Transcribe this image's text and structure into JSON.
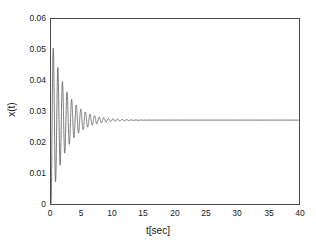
{
  "chart_data": {
    "type": "line",
    "title": "",
    "subtitle": "",
    "xlabel": "t[sec]",
    "ylabel": "x(t)",
    "xlim": [
      0,
      40
    ],
    "ylim": [
      0,
      0.06
    ],
    "grid": false,
    "legend": [],
    "legend_position": "none",
    "xticks": [
      0,
      5,
      10,
      15,
      20,
      25,
      30,
      35,
      40
    ],
    "xtick_labels": [
      "0",
      "5",
      "10",
      "15",
      "20",
      "25",
      "30",
      "35",
      "40"
    ],
    "yticks": [
      0,
      0.01,
      0.02,
      0.03,
      0.04,
      0.05,
      0.06
    ],
    "ytick_labels": [
      "0",
      "0.01",
      "0.02",
      "0.03",
      "0.04",
      "0.05",
      "0.06"
    ],
    "line_color": "#555555",
    "line_width": 0.8,
    "series": [
      {
        "name": "x(t)",
        "steady_state": 0.0272,
        "first_peak_value": 0.0515,
        "first_peak_time": 0.37,
        "first_trough_value": 0.0072,
        "first_trough_time": 0.74,
        "second_peak_value": 0.0445,
        "damped_period": 0.74,
        "damped_frequency_rad_s": 8.49,
        "decay_rate_per_s": 0.42,
        "settling_time": 22
      }
    ]
  },
  "axes": {
    "xlabel": "t[sec]",
    "ylabel": "x(t)"
  }
}
